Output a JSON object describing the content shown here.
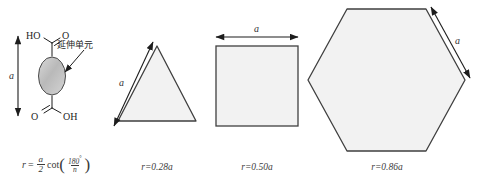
{
  "figure": {
    "title": "",
    "molecule": {
      "top_left_atom": "HO",
      "top_right_atom": "O",
      "bottom_left_atom": "O",
      "bottom_right_atom": "OH",
      "annotation_label": "延伸单元",
      "dimension_label": "a",
      "formula": {
        "lhs": "r",
        "equals": "=",
        "frac_numerator": "a",
        "frac_denominator": "2",
        "function": "cot",
        "inner_numerator": "180",
        "inner_degree": "°",
        "inner_denominator": "n"
      }
    },
    "shapes": [
      {
        "name": "triangle",
        "sides": 3,
        "side_label": "a",
        "caption": "r=0.28a",
        "r_value": 0.28
      },
      {
        "name": "square",
        "sides": 4,
        "side_label": "a",
        "caption": "r=0.50a",
        "r_value": 0.5
      },
      {
        "name": "hexagon",
        "sides": 6,
        "side_label": "a",
        "caption": "r=0.86a",
        "r_value": 0.86
      }
    ],
    "colors": {
      "stroke": "#3a3a3a",
      "fill": "#f2f2f2",
      "ellipse_fill": "#c9c9c9",
      "text": "#1d1d1d"
    }
  }
}
